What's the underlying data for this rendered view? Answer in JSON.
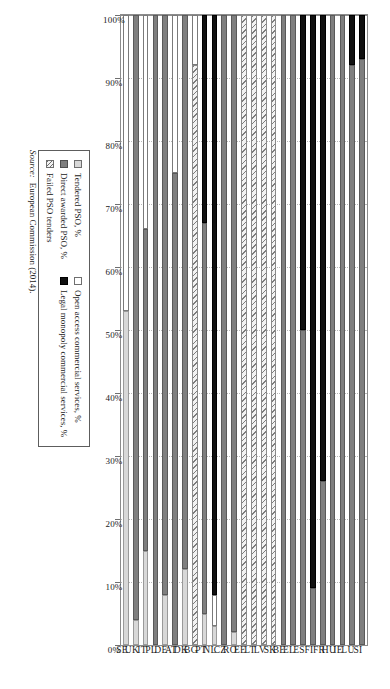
{
  "chart_data": {
    "type": "bar",
    "orientation": "horizontal",
    "stacked": true,
    "title": "",
    "xlabel": "",
    "ylabel": "",
    "xlim": [
      0,
      100
    ],
    "grid": true,
    "axis_direction": "right-to-left",
    "tick_labels": [
      "100%",
      "90%",
      "80%",
      "70%",
      "60%",
      "50%",
      "40%",
      "30%",
      "20%",
      "10%",
      "0%"
    ],
    "tick_values": [
      100,
      90,
      80,
      70,
      60,
      50,
      40,
      30,
      20,
      10,
      0
    ],
    "legend_position": "below-right",
    "categories": [
      "SI",
      "LU",
      "IE",
      "HU",
      "FR",
      "FI",
      "ES",
      "EL",
      "BE",
      "SK",
      "LV",
      "LT",
      "EE",
      "RO",
      "CZ",
      "NL",
      "PT",
      "BG",
      "DK",
      "AT",
      "DE",
      "PL",
      "IT",
      "UK",
      "SE"
    ],
    "series": [
      {
        "name": "Tendered PSO, %",
        "key": "tendered",
        "color": "#d8d8d8",
        "values": [
          0,
          0,
          0,
          0,
          0,
          0,
          0,
          0,
          0,
          0,
          0,
          0,
          0,
          2,
          0,
          3,
          5,
          0,
          12,
          0,
          8,
          0,
          15,
          4,
          53
        ]
      },
      {
        "name": "Direct awarded PSO, %",
        "key": "direct",
        "color": "#7f7f7f",
        "values": [
          93,
          92,
          100,
          100,
          26,
          9,
          50,
          100,
          100,
          0,
          0,
          0,
          0,
          98,
          100,
          0,
          62,
          0,
          88,
          75,
          92,
          100,
          51,
          96,
          0
        ]
      },
      {
        "name": "Failed PSO tenders",
        "key": "failed",
        "color": "#f2f2f2",
        "values": [
          0,
          0,
          0,
          0,
          0,
          0,
          0,
          0,
          0,
          100,
          100,
          100,
          100,
          0,
          0,
          0,
          0,
          92,
          0,
          0,
          0,
          0,
          0,
          0,
          0
        ]
      },
      {
        "name": "Open access commercial services, %",
        "key": "open",
        "color": "#ffffff",
        "values": [
          0,
          0,
          0,
          0,
          0,
          0,
          0,
          0,
          0,
          0,
          0,
          0,
          0,
          0,
          0,
          5,
          0,
          8,
          0,
          25,
          0,
          0,
          34,
          0,
          47
        ]
      },
      {
        "name": "Legal monopoly commercial services, %",
        "key": "monopoly",
        "color": "#111111",
        "values": [
          7,
          8,
          0,
          0,
          74,
          91,
          50,
          0,
          0,
          0,
          0,
          0,
          0,
          0,
          0,
          92,
          33,
          0,
          0,
          0,
          0,
          0,
          0,
          0,
          0
        ]
      }
    ],
    "stack_order": [
      "tendered",
      "direct",
      "failed",
      "open",
      "monopoly"
    ]
  },
  "legend": {
    "column_left": [
      {
        "label": "Tendered PSO, %",
        "swatch": "tendered"
      },
      {
        "label": "Direct awarded PSO, %",
        "swatch": "direct"
      },
      {
        "label": "Failed PSO tenders",
        "swatch": "failed"
      }
    ],
    "column_right": [
      {
        "label": "Open access commercial services, %",
        "swatch": "open"
      },
      {
        "label": "Legal monopoly commercial services, %",
        "swatch": "monopoly"
      }
    ]
  },
  "source": {
    "prefix": "Source:",
    "text": "European Commission (2014)."
  }
}
